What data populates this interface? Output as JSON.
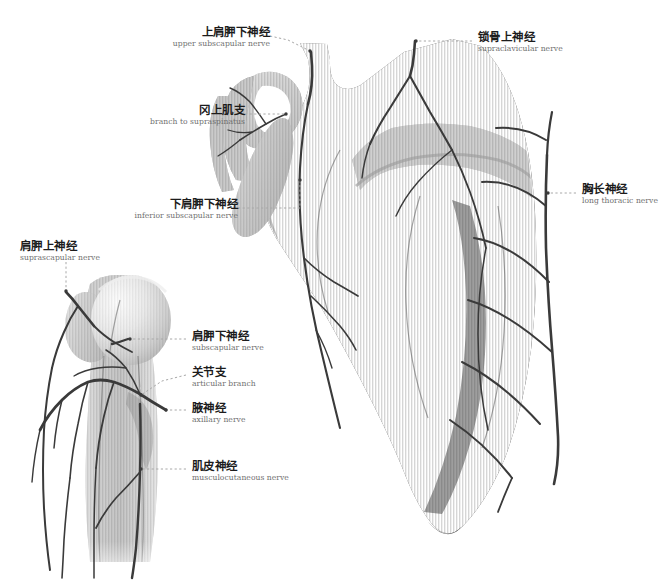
{
  "figure": {
    "title_cn": "",
    "title_en": "",
    "background_color": "#ffffff",
    "bone_dark_color": "#4a4a4a",
    "bone_mid_color": "#6e6e6e",
    "bone_light_color": "#9a9a9a",
    "bone_pale_color": "#c9c9c9",
    "nerve_color": "#3d3d3d",
    "leader_color": "#a6a6a6",
    "cn_text_color": "#1c1c1c",
    "en_text_color": "#6f6f6f"
  },
  "labels": [
    {
      "id": "upper-subscapular-nerve",
      "cn": "上肩胛下神经",
      "en": "upper subscapular nerve",
      "align": "right",
      "x": 188,
      "y": 26,
      "w": 100,
      "leader": "dotted",
      "target_x": 310,
      "target_y": 52
    },
    {
      "id": "branch-to-supraspinatus",
      "cn": "冈上肌支",
      "en": "branch to supraspinatus",
      "align": "right",
      "x": 124,
      "y": 104,
      "w": 130,
      "leader": "dotted",
      "target_x": 285,
      "target_y": 115
    },
    {
      "id": "inferior-subscapular-nerve",
      "cn": "下肩胛下神经",
      "en": "inferior subscapular nerve",
      "align": "right",
      "x": 104,
      "y": 198,
      "w": 140,
      "leader": "dotted",
      "target_x": 300,
      "target_y": 208
    },
    {
      "id": "supraclavicular-nerve",
      "cn": "锁骨上神经",
      "en": "supraclavicular nerve",
      "align": "left",
      "x": 478,
      "y": 34,
      "w": 130,
      "leader": "dotted",
      "target_x": 414,
      "target_y": 41
    },
    {
      "id": "long-thoracic-nerve",
      "cn": "胸长神经",
      "en": "long thoracic nerve",
      "align": "left",
      "x": 582,
      "y": 186,
      "w": 100,
      "leader": "dotted",
      "target_x": 548,
      "target_y": 193
    },
    {
      "id": "suprascapular-nerve",
      "cn": "肩胛上神经",
      "en": "suprascapular nerve",
      "align": "left",
      "x": 20,
      "y": 240,
      "w": 110,
      "leader": "dotted-vertical",
      "target_x": 66,
      "target_y": 292
    },
    {
      "id": "subscapular-nerve",
      "cn": "肩胛下神经",
      "en": "subscapular nerve",
      "align": "left",
      "x": 192,
      "y": 332,
      "w": 110,
      "leader": "dotted",
      "target_x": 128,
      "target_y": 339
    },
    {
      "id": "articular-branch",
      "cn": "关节支",
      "en": "articular branch",
      "align": "left",
      "x": 192,
      "y": 368,
      "w": 100,
      "leader": "dotted",
      "target_x": 140,
      "target_y": 397
    },
    {
      "id": "axillary-nerve",
      "cn": "腋神经",
      "en": "axillary nerve",
      "align": "left",
      "x": 192,
      "y": 404,
      "w": 100,
      "leader": "dotted",
      "target_x": 163,
      "target_y": 409
    },
    {
      "id": "musculocutaneous-nerve",
      "cn": "肌皮神经",
      "en": "musculocutaneous nerve",
      "align": "left",
      "x": 192,
      "y": 462,
      "w": 130,
      "leader": "dotted",
      "target_x": 140,
      "target_y": 469
    }
  ],
  "structures": [
    {
      "id": "scapula",
      "cn": "肩胛骨",
      "en": "scapula"
    },
    {
      "id": "humerus",
      "cn": "肱骨",
      "en": "humerus"
    },
    {
      "id": "coracoid-process",
      "cn": "喙突",
      "en": "coracoid process"
    },
    {
      "id": "acromion",
      "cn": "肩峰",
      "en": "acromion"
    },
    {
      "id": "humeral-head",
      "cn": "肱骨头",
      "en": "head of humerus"
    },
    {
      "id": "ribs",
      "cn": "肋骨",
      "en": "ribs"
    }
  ]
}
